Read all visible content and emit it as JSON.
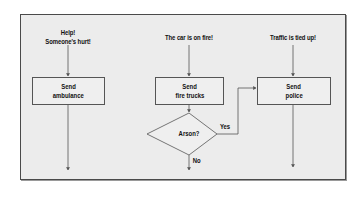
{
  "diagram": {
    "type": "flowchart",
    "columns": [
      {
        "trigger": [
          "Help!",
          "Someone's hurt!"
        ],
        "action": [
          "Send",
          "ambulance"
        ]
      },
      {
        "trigger": [
          "The car is on fire!"
        ],
        "action": [
          "Send",
          "fire trucks"
        ],
        "decision": {
          "question": "Arson?",
          "yes_label": "Yes",
          "no_label": "No",
          "yes_target": "Send police"
        }
      },
      {
        "trigger": [
          "Traffic is tied up!"
        ],
        "action": [
          "Send",
          "police"
        ]
      }
    ],
    "colors": {
      "background": "#ececec",
      "border": "#4a4a4a",
      "line": "#555555"
    }
  }
}
